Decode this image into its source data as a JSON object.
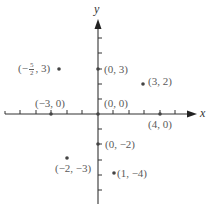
{
  "diagram": {
    "type": "coordinate-plane",
    "axes": {
      "x_label": "x",
      "y_label": "y",
      "x_ticks": [
        -6,
        -5,
        -4,
        -3,
        -2,
        -1,
        1,
        2,
        3,
        4,
        5
      ],
      "y_ticks": [
        -6,
        -5,
        -4,
        -3,
        -2,
        -1,
        1,
        2,
        3,
        4,
        5
      ],
      "color": "#333333"
    },
    "points": [
      {
        "x": -2.5,
        "y": 3,
        "label_prefix": "(−",
        "label_num": "5",
        "label_den": "2",
        "label_suffix": ", 3)"
      },
      {
        "x": 0,
        "y": 3,
        "label": "(0, 3)"
      },
      {
        "x": 3,
        "y": 2,
        "label": "(3, 2)"
      },
      {
        "x": -3,
        "y": 0,
        "label": "(−3, 0)"
      },
      {
        "x": 0,
        "y": 0,
        "label": "(0, 0)"
      },
      {
        "x": 4,
        "y": 0,
        "label": "(4, 0)"
      },
      {
        "x": 0,
        "y": -2,
        "label": "(0, −2)"
      },
      {
        "x": -2,
        "y": -3,
        "label": "(−2, −3)"
      },
      {
        "x": 1,
        "y": -4,
        "label": "(1, −4)"
      }
    ],
    "point_color": "#555555",
    "label_color": "#5a5a5a"
  }
}
